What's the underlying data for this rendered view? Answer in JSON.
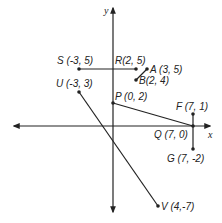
{
  "axes": {
    "x_label": "x",
    "y_label": "y"
  },
  "points": {
    "S": {
      "label": "S (-3, 5)"
    },
    "R": {
      "label": "R(2, 5)"
    },
    "A": {
      "label": "A (3, 5)"
    },
    "B": {
      "label": "B(2, 4)"
    },
    "U": {
      "label": "U (-3, 3)"
    },
    "P": {
      "label": "P (0, 2)"
    },
    "F": {
      "label": "F (7, 1)"
    },
    "Q": {
      "label": "Q (7, 0)"
    },
    "G": {
      "label": "G (7, -2)"
    },
    "V": {
      "label": "V (4,-7)"
    }
  },
  "segments": [
    {
      "from": "S",
      "to": "R"
    },
    {
      "from": "A",
      "to": "B"
    },
    {
      "from": "U",
      "to": "V"
    },
    {
      "from": "P",
      "to": "Q"
    },
    {
      "from": "F",
      "to": "G"
    }
  ],
  "colors": {
    "ink": "#222222",
    "background": "#ffffff"
  }
}
